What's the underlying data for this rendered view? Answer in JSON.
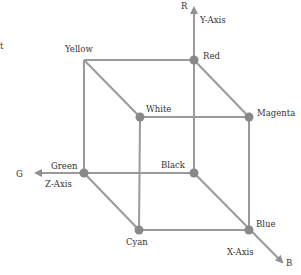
{
  "diagram": {
    "colors": {
      "line": "#9a9a9a",
      "vertex": "#888888",
      "text": "#333333",
      "background": "#ffffff"
    },
    "axes": [
      {
        "id": "y",
        "label": "Y-Axis",
        "end_label": "R"
      },
      {
        "id": "z",
        "label": "Z-Axis",
        "end_label": "G"
      },
      {
        "id": "x",
        "label": "X-Axis",
        "end_label": "B"
      }
    ],
    "vertices": [
      {
        "id": "yellow",
        "label": "Yellow"
      },
      {
        "id": "red",
        "label": "Red"
      },
      {
        "id": "white",
        "label": "White"
      },
      {
        "id": "magenta",
        "label": "Magenta"
      },
      {
        "id": "green",
        "label": "Green"
      },
      {
        "id": "black",
        "label": "Black"
      },
      {
        "id": "cyan",
        "label": "Cyan"
      },
      {
        "id": "blue",
        "label": "Blue"
      }
    ],
    "stray_mark": "t"
  }
}
